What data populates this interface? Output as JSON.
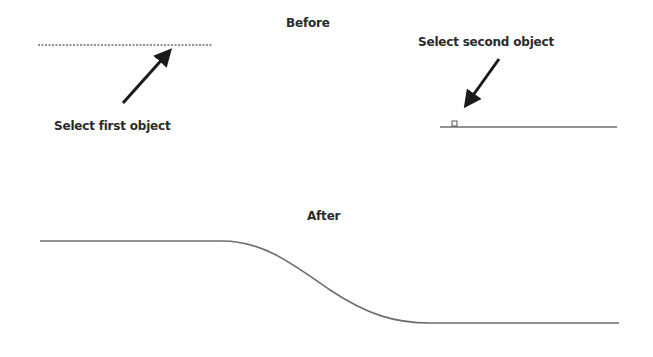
{
  "before": {
    "title": "Before",
    "first_label": "Select first object",
    "second_label": "Select second object"
  },
  "after": {
    "title": "After"
  },
  "colors": {
    "background": "#ffffff",
    "line": "#6e6e6e",
    "arrow": "#1a1a1a",
    "text": "#2a2a2a"
  }
}
